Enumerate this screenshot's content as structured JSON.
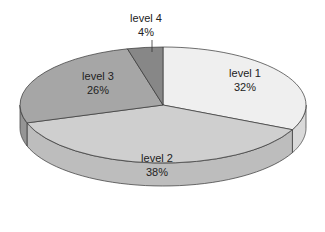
{
  "chart_data": {
    "type": "pie",
    "style": "3d",
    "title": "",
    "categories": [
      "level 1",
      "level 2",
      "level 3",
      "level 4"
    ],
    "values": [
      32,
      38,
      26,
      4
    ],
    "labels": [
      {
        "name": "level 1",
        "percent": "32%"
      },
      {
        "name": "level 2",
        "percent": "38%"
      },
      {
        "name": "level 3",
        "percent": "26%"
      },
      {
        "name": "level 4",
        "percent": "4%"
      }
    ],
    "colors": [
      "#efefef",
      "#cfcfcf",
      "#a6a6a6",
      "#878787"
    ],
    "side_colors": [
      "#d9d9d9",
      "#bdbdbd",
      "#959595",
      "#747474"
    ],
    "legend": "none",
    "label_position": "inside; level 4 outside with leader line"
  }
}
